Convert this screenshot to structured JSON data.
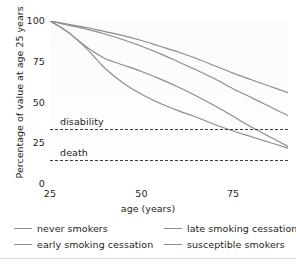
{
  "chart_data": {
    "type": "line",
    "title": "",
    "xlabel": "age (years)",
    "ylabel": "Percentage of value at age 25 years",
    "xlim": [
      25,
      90
    ],
    "ylim": [
      0,
      100
    ],
    "xticks": [
      25,
      50,
      75
    ],
    "yticks": [
      0,
      25,
      50,
      75,
      100
    ],
    "grid": false,
    "legend_position": "below",
    "series": [
      {
        "name": "never smokers",
        "color": "#8c8c8c",
        "x": [
          25,
          30,
          35,
          40,
          45,
          50,
          55,
          60,
          65,
          70,
          75,
          80,
          85,
          90
        ],
        "values": [
          100,
          98,
          96,
          93.5,
          91,
          88,
          84.5,
          81,
          77,
          72.5,
          68,
          64,
          60,
          56
        ]
      },
      {
        "name": "late smoking cessation",
        "color": "#8c8c8c",
        "x": [
          25,
          30,
          35,
          40,
          45,
          50,
          55,
          60,
          65,
          70,
          75,
          80,
          85,
          90
        ],
        "values": [
          100,
          97.5,
          95,
          92,
          88.5,
          84.5,
          80,
          75,
          70,
          64.5,
          58.5,
          53,
          47.5,
          42
        ]
      },
      {
        "name": "early smoking cessation",
        "color": "#8c8c8c",
        "x": [
          25,
          30,
          35,
          40,
          45,
          50,
          55,
          60,
          65,
          70,
          75,
          80,
          85,
          90
        ],
        "values": [
          100,
          93,
          84,
          77,
          73,
          69,
          64.5,
          59.5,
          54,
          48,
          41.5,
          35,
          29,
          23
        ]
      },
      {
        "name": "susceptible smokers",
        "color": "#8c8c8c",
        "x": [
          25,
          30,
          35,
          40,
          45,
          50,
          55,
          60,
          65,
          70,
          75,
          80,
          85,
          90
        ],
        "values": [
          100,
          93,
          83,
          71,
          62,
          55,
          49.5,
          45,
          41,
          36.5,
          32.5,
          29,
          25.5,
          22
        ]
      }
    ],
    "reference_lines": [
      {
        "label": "disability",
        "value": 34,
        "style": "dashed",
        "color": "#3b3b3b"
      },
      {
        "label": "death",
        "value": 15,
        "style": "dashed",
        "color": "#3b3b3b"
      }
    ]
  },
  "axes": {
    "x_title": "age (years)",
    "y_title": "Percentage of value at age 25 years",
    "x_tick_labels": [
      "25",
      "50",
      "75"
    ],
    "y_tick_labels": [
      "100",
      "75",
      "50",
      "25",
      "0"
    ]
  },
  "reference_labels": {
    "disability": "disability",
    "death": "death"
  },
  "legend": {
    "entries": [
      {
        "label": "never smokers"
      },
      {
        "label": "late smoking cessation"
      },
      {
        "label": "early smoking cessation"
      },
      {
        "label": "susceptible smokers"
      }
    ]
  },
  "colors": {
    "curve": "#8c8c8c",
    "reference": "#3b3b3b",
    "text": "#231f20",
    "plot_background": "#fcfcfc",
    "page_background": "#ffffff"
  }
}
